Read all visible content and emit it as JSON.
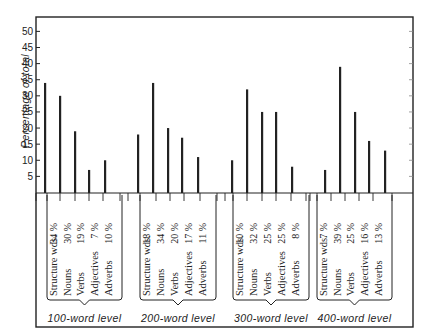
{
  "chart_data": {
    "type": "bar",
    "title": "",
    "xlabel": "",
    "ylabel": "Percentage of total",
    "ylim": [
      0,
      55
    ],
    "yticks": [
      5,
      10,
      15,
      20,
      25,
      30,
      35,
      40,
      45,
      50
    ],
    "grid": false,
    "legend": null,
    "categories": [
      "Structure wds.",
      "Nouns",
      "Verbs",
      "Adjectives",
      "Adverbs"
    ],
    "groups": [
      {
        "name": "100-word level",
        "values": [
          34,
          30,
          19,
          7,
          10
        ],
        "labels": [
          "34 %",
          "30 %",
          "19 %",
          "7 %",
          "10 %"
        ]
      },
      {
        "name": "200-word level",
        "values": [
          18,
          34,
          20,
          17,
          11
        ],
        "labels": [
          "18 %",
          "34 %",
          "20 %",
          "17 %",
          "11 %"
        ]
      },
      {
        "name": "300-word level",
        "values": [
          10,
          32,
          25,
          25,
          8
        ],
        "labels": [
          "10 %",
          "32 %",
          "25 %",
          "25 %",
          "8 %"
        ]
      },
      {
        "name": "400-word level",
        "values": [
          7,
          39,
          25,
          16,
          13
        ],
        "labels": [
          "7 %",
          "39 %",
          "25 %",
          "16 %",
          "13 %"
        ]
      }
    ],
    "series": [
      {
        "name": "100-word level",
        "values": [
          34,
          30,
          19,
          7,
          10
        ]
      },
      {
        "name": "200-word level",
        "values": [
          18,
          34,
          20,
          17,
          11
        ]
      },
      {
        "name": "300-word level",
        "values": [
          10,
          32,
          25,
          25,
          8
        ]
      },
      {
        "name": "400-word level",
        "values": [
          7,
          39,
          25,
          16,
          13
        ]
      }
    ],
    "annotations": [
      "Bar heights as drawn in original figure; printed percentage labels shown in table beneath"
    ]
  },
  "colors": {
    "ink": "#222222",
    "paper": "#ffffff"
  }
}
